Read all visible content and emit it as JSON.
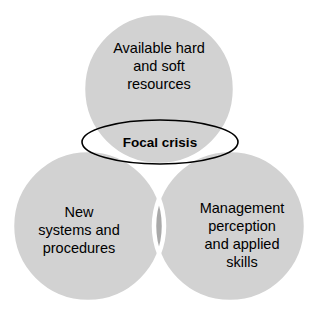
{
  "diagram": {
    "type": "venn-3-circle",
    "background_color": "#ffffff",
    "circle_fill": "#d2d2d2",
    "overlap_fill": "#a9a9a9",
    "separator_color": "#ffffff",
    "outline_color": "#000000",
    "text_color": "#000000",
    "circles": [
      {
        "id": "resources",
        "position": "top",
        "cx": 159,
        "cy": 89,
        "r": 76,
        "lines": [
          "Available hard",
          "and soft",
          "resources"
        ],
        "label_line_1": "Available hard",
        "label_line_2": "and soft",
        "label_line_3": "resources"
      },
      {
        "id": "systems",
        "position": "bottom-left",
        "cx": 88,
        "cy": 226,
        "r": 76,
        "lines": [
          "New",
          "systems and",
          "procedures"
        ],
        "label_line_1": "New",
        "label_line_2": "systems and",
        "label_line_3": "procedures"
      },
      {
        "id": "management",
        "position": "bottom-right",
        "cx": 230,
        "cy": 226,
        "r": 76,
        "lines": [
          "Management",
          "perception",
          "and applied",
          "skills"
        ],
        "label_line_1": "Management",
        "label_line_2": "perception",
        "label_line_3": "and applied",
        "label_line_4": "skills"
      }
    ],
    "highlight": {
      "id": "focal-crisis",
      "shape": "ellipse",
      "label": "Focal crisis",
      "cx": 160,
      "cy": 142,
      "rx": 78,
      "ry": 22,
      "stroke": "#000000",
      "stroke_width": 1.6,
      "fill": "none",
      "bold": true
    }
  }
}
